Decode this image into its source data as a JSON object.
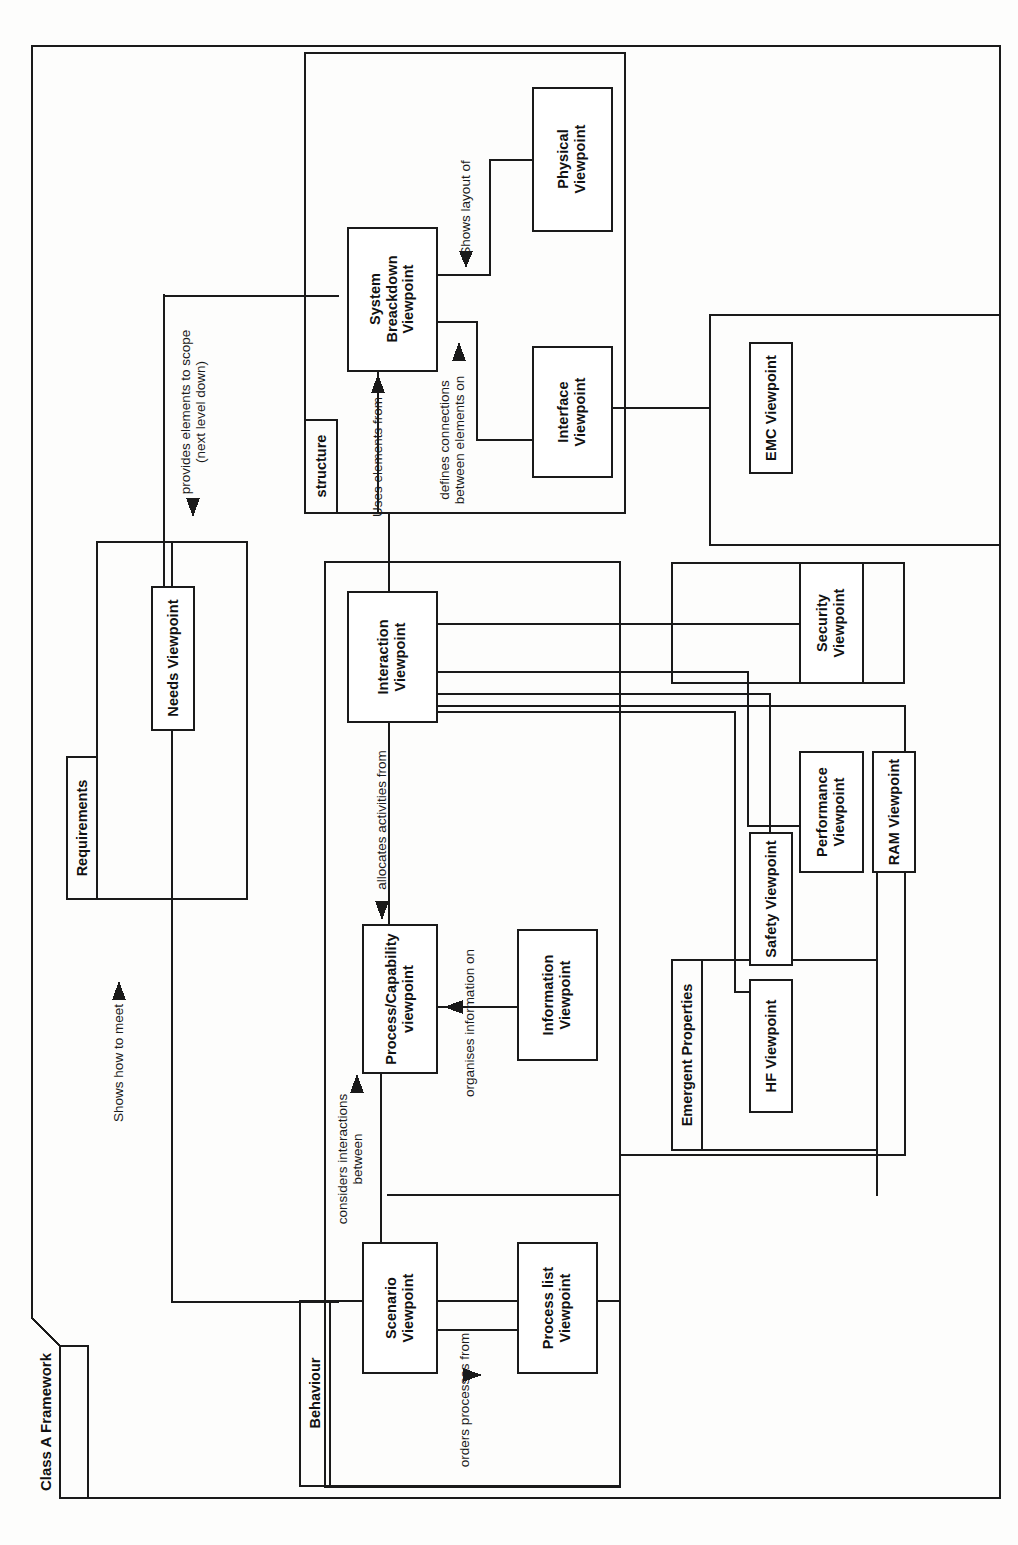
{
  "diagram": {
    "type": "uml-package-framework-diagram",
    "frame_title": "Class A Framework",
    "orientation": "rotated-90-ccw",
    "groups": [
      {
        "id": "structure",
        "label": "structure"
      },
      {
        "id": "requirements",
        "label": "Requirements"
      },
      {
        "id": "behaviour",
        "label": "Behaviour"
      },
      {
        "id": "emergent",
        "label": "Emergent Properties"
      }
    ],
    "nodes": [
      {
        "id": "physical",
        "label": "Physical\nViewpoint",
        "group": "structure"
      },
      {
        "id": "sysbd",
        "label": "System\nBreackdown\nViewpoint",
        "group": "structure"
      },
      {
        "id": "interface",
        "label": "Interface\nViewpoint",
        "group": "structure"
      },
      {
        "id": "emc",
        "label": "EMC Viewpoint",
        "group": ""
      },
      {
        "id": "needs",
        "label": "Needs Viewpoint",
        "group": "requirements"
      },
      {
        "id": "interaction",
        "label": "Interaction\nViewpoint",
        "group": ""
      },
      {
        "id": "security",
        "label": "Security\nViewpoint",
        "group": ""
      },
      {
        "id": "performance",
        "label": "Performance\nViewpoint",
        "group": "emergent"
      },
      {
        "id": "ram",
        "label": "RAM Viewpoint",
        "group": "emergent"
      },
      {
        "id": "safety",
        "label": "Safety Viewpoint",
        "group": "emergent"
      },
      {
        "id": "hf",
        "label": "HF Viewpoint",
        "group": "emergent"
      },
      {
        "id": "process",
        "label": "Process/Capability\nviewpoint",
        "group": ""
      },
      {
        "id": "information",
        "label": "Information\nViewpoint",
        "group": ""
      },
      {
        "id": "scenario",
        "label": "Scenario\nViewpoint",
        "group": "behaviour"
      },
      {
        "id": "processlist",
        "label": "Process list\nViewpoint",
        "group": "behaviour"
      }
    ],
    "edge_labels": [
      {
        "id": "shows-layout-of",
        "text": "Shows layout of"
      },
      {
        "id": "provides-elements",
        "text": "provides elements to scope\n(next level down)"
      },
      {
        "id": "uses-elements-from",
        "text": "Uses elements from"
      },
      {
        "id": "defines-connections",
        "text": "defines connections\nbetween elements on"
      },
      {
        "id": "shows-how-to-meet",
        "text": "Shows how to meet"
      },
      {
        "id": "allocates-activities",
        "text": "allocates activities from"
      },
      {
        "id": "organises-information",
        "text": "organises information on"
      },
      {
        "id": "considers-interactions",
        "text": "considers interactions\nbetween"
      },
      {
        "id": "orders-processes",
        "text": "orders processes from"
      }
    ],
    "colors": {
      "stroke": "#1a1a1a",
      "text": "#111111",
      "background": "#fdfdfc"
    }
  }
}
